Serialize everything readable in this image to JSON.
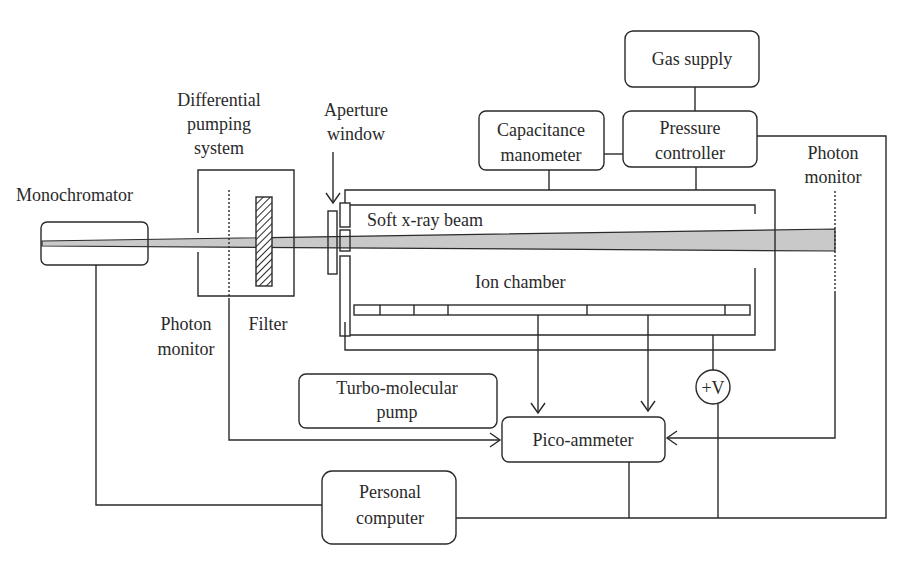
{
  "diagram": {
    "type": "experimental-setup-schematic",
    "labels": {
      "gas_supply": "Gas supply",
      "differential_pumping": [
        "Differential",
        "pumping",
        "system"
      ],
      "aperture_window": [
        "Aperture",
        "window"
      ],
      "capacitance_manometer": [
        "Capacitance",
        "manometer"
      ],
      "pressure_controller": [
        "Pressure",
        "controller"
      ],
      "photon_monitor_right": [
        "Photon",
        "monitor"
      ],
      "monochromator": "Monochromator",
      "soft_xray_beam": "Soft x-ray beam",
      "ion_chamber": "Ion chamber",
      "photon_monitor_left": [
        "Photon",
        "monitor"
      ],
      "filter": "Filter",
      "turbo_pump": [
        "Turbo-molecular",
        "pump"
      ],
      "voltage_source": "+V",
      "pico_ammeter": "Pico-ammeter",
      "personal_computer": [
        "Personal",
        "computer"
      ]
    },
    "colors": {
      "line": "#2a2a2a",
      "beam_fill": "#c9c9c9",
      "background": "#ffffff"
    },
    "connections": [
      {
        "from": "gas_supply",
        "to": "pressure_controller"
      },
      {
        "from": "capacitance_manometer",
        "to": "pressure_controller"
      },
      {
        "from": "capacitance_manometer",
        "to": "ion_chamber"
      },
      {
        "from": "pressure_controller",
        "to": "ion_chamber"
      },
      {
        "from": "pressure_controller",
        "to": "personal_computer"
      },
      {
        "from": "ion_chamber_electrode_1",
        "to": "pico_ammeter",
        "arrow": true
      },
      {
        "from": "ion_chamber_electrode_2",
        "to": "pico_ammeter",
        "arrow": true
      },
      {
        "from": "photon_monitor_left",
        "to": "pico_ammeter",
        "arrow": true
      },
      {
        "from": "photon_monitor_right",
        "to": "pico_ammeter",
        "arrow": true
      },
      {
        "from": "voltage_source",
        "to": "ion_chamber"
      },
      {
        "from": "pico_ammeter",
        "to": "personal_computer"
      },
      {
        "from": "voltage_source",
        "to": "personal_computer"
      },
      {
        "from": "monochromator",
        "to": "personal_computer"
      }
    ]
  }
}
